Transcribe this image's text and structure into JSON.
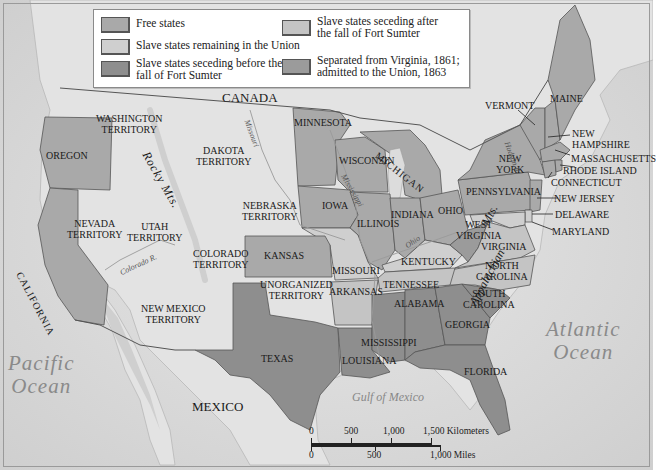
{
  "legend": {
    "items": [
      {
        "label_lines": [
          "Free states"
        ],
        "color": "#a9a9a9"
      },
      {
        "label_lines": [
          "Slave states remaining in the Union"
        ],
        "color": "#cfcfcf"
      },
      {
        "label_lines": [
          "Slave states seceding before the",
          "fall of Fort Sumter"
        ],
        "color": "#8e8e8e"
      },
      {
        "label_lines": [
          "Slave states seceding after",
          "the fall of Fort Sumter"
        ],
        "color": "#c4c4c4"
      },
      {
        "label_lines": [
          "Separated from Virginia, 1861;",
          "admitted to the Union, 1863"
        ],
        "color": "#9b9b9b"
      }
    ]
  },
  "colors": {
    "background_land": "#e4e4e4",
    "ocean": "#d2d2d2",
    "free": "#a9a9a9",
    "border_slave": "#cfcfcf",
    "seceded_before": "#8e8e8e",
    "seceded_after": "#c4c4c4",
    "west_virginia": "#9b9b9b",
    "territory": "#e8e8e8",
    "border_line": "#555555"
  },
  "regions": {
    "canada": "CANADA",
    "mexico": "MEXICO",
    "pacific": [
      "Pacific",
      "Ocean"
    ],
    "atlantic": [
      "Atlantic",
      "Ocean"
    ],
    "gulf": "Gulf of Mexico"
  },
  "territories": {
    "washington": [
      "WASHINGTON",
      "TERRITORY"
    ],
    "dakota": [
      "DAKOTA",
      "TERRITORY"
    ],
    "nebraska": [
      "NEBRASKA",
      "TERRITORY"
    ],
    "nevada": [
      "NEVADA",
      "TERRITORY"
    ],
    "utah": [
      "UTAH",
      "TERRITORY"
    ],
    "colorado": [
      "COLORADO",
      "TERRITORY"
    ],
    "new_mexico": [
      "NEW MEXICO",
      "TERRITORY"
    ],
    "unorganized": [
      "UNORGANIZED",
      "TERRITORY"
    ]
  },
  "states": {
    "oregon": "OREGON",
    "california": "CALIFORNIA",
    "minnesota": "MINNESOTA",
    "wisconsin": "WISCONSIN",
    "michigan": "MICHIGAN",
    "iowa": "IOWA",
    "illinois": "ILLINOIS",
    "indiana": "INDIANA",
    "ohio": "OHIO",
    "kansas": "KANSAS",
    "missouri": "MISSOURI",
    "kentucky": "KENTUCKY",
    "arkansas": "ARKANSAS",
    "tennessee": "TENNESSEE",
    "texas": "TEXAS",
    "louisiana": "LOUISIANA",
    "mississippi": "MISSISSIPPI",
    "alabama": "ALABAMA",
    "georgia": "GEORGIA",
    "florida": "FLORIDA",
    "south_carolina": [
      "SOUTH",
      "CAROLINA"
    ],
    "north_carolina": [
      "NORTH",
      "CAROLINA"
    ],
    "virginia": "VIRGINIA",
    "west_virginia": [
      "WEST",
      "VIRGINIA"
    ],
    "pennsylvania": "PENNSYLVANIA",
    "new_york": [
      "NEW",
      "YORK"
    ],
    "vermont": "VERMONT",
    "maine": "MAINE",
    "new_hampshire": [
      "NEW",
      "HAMPSHIRE"
    ],
    "massachusetts": "MASSACHUSETTS",
    "rhode_island": "RHODE ISLAND",
    "connecticut": "CONNECTICUT",
    "new_jersey": "NEW JERSEY",
    "delaware": "DELAWARE",
    "maryland": "MARYLAND"
  },
  "features": {
    "rocky_mts": "Rocky Mts.",
    "appalachian_mts": "Appalachian",
    "appalachian_mts2": "Mts.",
    "missouri_r": "Missouri",
    "mississippi_r": "Mississippi",
    "ohio_r": "Ohio",
    "colorado_r": "Colorado R.",
    "hudson_r": "Hudson R.",
    "river_r": "R."
  },
  "scale": {
    "km_ticks": [
      "0",
      "500",
      "1,000",
      "1,500 Kilometers"
    ],
    "mi_ticks": [
      "0",
      "500",
      "1,000 Miles"
    ]
  }
}
